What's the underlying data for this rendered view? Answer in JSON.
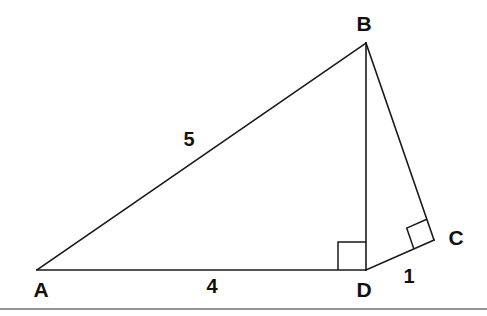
{
  "figure": {
    "kind": "geometry-diagram",
    "background_color": "#ffffff",
    "stroke_color": "#1a1a1a",
    "rule_color": "#6e6e72",
    "canvas": {
      "width": 487,
      "height": 316
    }
  },
  "vertices": [
    {
      "id": "A",
      "label": "A",
      "x": 37,
      "y": 270,
      "label_x": 41,
      "label_y": 289
    },
    {
      "id": "B",
      "label": "B",
      "x": 366,
      "y": 43,
      "label_x": 364,
      "label_y": 23
    },
    {
      "id": "C",
      "label": "C",
      "x": 434,
      "y": 240,
      "label_x": 456,
      "label_y": 237
    },
    {
      "id": "D",
      "label": "D",
      "x": 366,
      "y": 270,
      "label_x": 364,
      "label_y": 289
    }
  ],
  "segments": [
    {
      "id": "AB",
      "from": "A",
      "to": "B",
      "label": "5"
    },
    {
      "id": "AD",
      "from": "A",
      "to": "D",
      "label": "4"
    },
    {
      "id": "BD",
      "from": "B",
      "to": "D",
      "label": ""
    },
    {
      "id": "BC",
      "from": "B",
      "to": "C",
      "label": ""
    },
    {
      "id": "DC",
      "from": "D",
      "to": "C",
      "label": "1"
    }
  ],
  "length_labels": [
    {
      "id": "len-AB",
      "text": "5",
      "x": 189,
      "y": 139,
      "for_segment": "AB"
    },
    {
      "id": "len-AD",
      "text": "4",
      "x": 212,
      "y": 286,
      "for_segment": "AD"
    },
    {
      "id": "len-DC",
      "text": "1",
      "x": 409,
      "y": 276,
      "for_segment": "DC"
    }
  ],
  "right_angles": [
    {
      "id": "right-angle-at-D",
      "at_vertex": "D",
      "note": "90 degrees between DA and DB",
      "size": 28
    },
    {
      "id": "right-angle-at-C",
      "at_vertex": "C",
      "note": "90 degrees between CB and CD",
      "size": 22
    }
  ],
  "page_rule": {
    "id": "bottom-rule",
    "y": 309,
    "x1": 0,
    "x2": 487
  }
}
